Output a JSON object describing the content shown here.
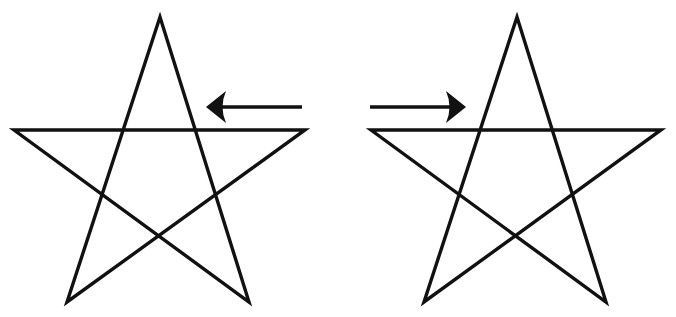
{
  "figure": {
    "stroke_color": "#111111",
    "background_color": "#ffffff",
    "stars": [
      {
        "id": "left",
        "vertices": {
          "top": [
            160,
            17
          ],
          "left": [
            14,
            130
          ],
          "right": [
            305,
            130
          ],
          "bottom_left": [
            67,
            302
          ],
          "bottom_right": [
            249,
            302
          ]
        }
      },
      {
        "id": "right",
        "vertices": {
          "top": [
            517,
            17
          ],
          "left": [
            371,
            130
          ],
          "right": [
            661,
            130
          ],
          "bottom_left": [
            424,
            302
          ],
          "bottom_right": [
            606,
            302
          ]
        }
      }
    ],
    "arrows": [
      {
        "id": "left-arrow",
        "direction": "left",
        "tail": [
          302,
          107
        ],
        "tip": [
          206,
          107
        ]
      },
      {
        "id": "right-arrow",
        "direction": "right",
        "tail": [
          370,
          107
        ],
        "tip": [
          466,
          107
        ]
      }
    ]
  }
}
